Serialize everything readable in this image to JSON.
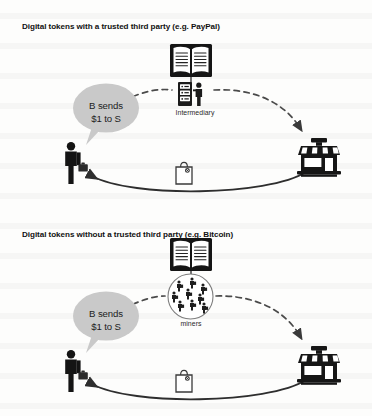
{
  "document": {
    "type": "diagram",
    "background_color": "#fdfdfc",
    "ink_color": "#1a1a1a"
  },
  "panels": [
    {
      "id": "with-third-party",
      "title": "Digital tokens with a trusted third party (e.g. PayPal)",
      "bubble_text_line1": "B sends",
      "bubble_text_line2": "$1 to S",
      "bubble_color": "#c9c9c9",
      "intermediary_label": "Intermediary",
      "icons": {
        "ledger": "open-book-icon",
        "middle_node": "server-rack-with-person-icon",
        "buyer": "person-with-briefcase-icon",
        "seller": "storefront-icon",
        "goods": "shopping-bag-icon"
      },
      "flows": {
        "payment_path": "dashed",
        "goods_path": "solid"
      }
    },
    {
      "id": "without-third-party",
      "title": "Digital tokens without a trusted third party (e.g. Bitcoin)",
      "bubble_text_line1": "B sends",
      "bubble_text_line2": "$1 to S",
      "bubble_color": "#c9c9c9",
      "intermediary_label": "miners",
      "icons": {
        "ledger": "open-book-icon",
        "middle_node": "miners-network-circle-icon",
        "buyer": "person-with-briefcase-icon",
        "seller": "storefront-icon",
        "goods": "shopping-bag-icon"
      },
      "flows": {
        "payment_path": "dashed",
        "goods_path": "solid"
      }
    }
  ]
}
